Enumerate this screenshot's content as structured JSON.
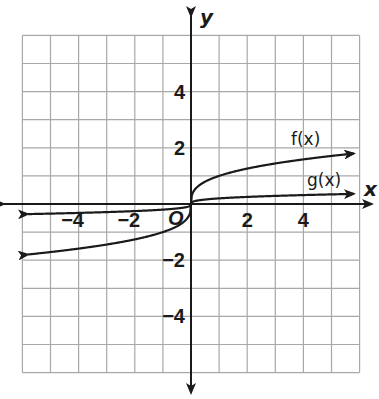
{
  "chart_data": {
    "type": "line",
    "title": "",
    "xlabel": "x",
    "ylabel": "y",
    "origin_label": "O",
    "xlim": [
      -6,
      6
    ],
    "ylim": [
      -6,
      6
    ],
    "grid": true,
    "grid_step": 1,
    "x_ticks": [
      {
        "value": -4,
        "label": "−4"
      },
      {
        "value": -2,
        "label": "−2"
      },
      {
        "value": 2,
        "label": "2"
      },
      {
        "value": 4,
        "label": "4"
      }
    ],
    "y_ticks": [
      {
        "value": 4,
        "label": "4"
      },
      {
        "value": 2,
        "label": "2"
      },
      {
        "value": -2,
        "label": "−2"
      },
      {
        "value": -4,
        "label": "−4"
      }
    ],
    "series": [
      {
        "name": "f(x)",
        "label": "f(x)",
        "shape": "cube-root",
        "x": [
          -5.8,
          -4,
          -2,
          -1,
          -0.3,
          0,
          0.3,
          1,
          2,
          4,
          5.8
        ],
        "y": [
          -1.8,
          -1.59,
          -1.26,
          -1.0,
          -0.67,
          0,
          0.67,
          1.0,
          1.26,
          1.59,
          1.8
        ],
        "arrows": "both"
      },
      {
        "name": "g(x)",
        "label": "g(x)",
        "shape": "cube-root (vertically compressed)",
        "x": [
          -5.8,
          -4,
          -2,
          -1,
          0,
          1,
          2,
          4,
          5.8
        ],
        "y": [
          -0.36,
          -0.32,
          -0.25,
          -0.2,
          0,
          0.2,
          0.25,
          0.32,
          0.36
        ],
        "arrows": "both"
      }
    ]
  }
}
